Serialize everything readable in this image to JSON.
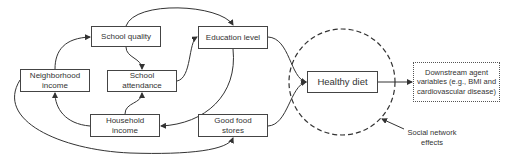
{
  "diagram": {
    "nodes": {
      "neighborhood_income": {
        "label": "Neighborhood income"
      },
      "school_quality": {
        "label": "School quality"
      },
      "school_attendance": {
        "label": "School attendance"
      },
      "education_level": {
        "label": "Education level"
      },
      "household_income": {
        "label": "Household income"
      },
      "good_food_stores": {
        "label": "Good food stores"
      },
      "healthy_diet": {
        "label": "Healthy diet"
      },
      "downstream": {
        "label": "Downstream agent variables (e.g., BMI and cardiovascular disease)"
      }
    },
    "annotations": {
      "social_network": {
        "label": "Social network effects"
      }
    },
    "edges": [
      {
        "from": "Neighborhood income",
        "to": "School quality"
      },
      {
        "from": "Neighborhood income",
        "to": "Good food stores"
      },
      {
        "from": "School quality",
        "to": "School attendance"
      },
      {
        "from": "School quality",
        "to": "Education level"
      },
      {
        "from": "School attendance",
        "to": "Education level"
      },
      {
        "from": "Education level",
        "to": "Household income"
      },
      {
        "from": "Household income",
        "to": "Neighborhood income"
      },
      {
        "from": "Household income",
        "to": "School attendance"
      },
      {
        "from": "Education level",
        "to": "Healthy diet"
      },
      {
        "from": "Good food stores",
        "to": "Healthy diet"
      },
      {
        "from": "Healthy diet",
        "to": "Downstream agent variables"
      }
    ],
    "colors": {
      "line": "#333333",
      "border": "#444444",
      "background": "#ffffff"
    }
  }
}
